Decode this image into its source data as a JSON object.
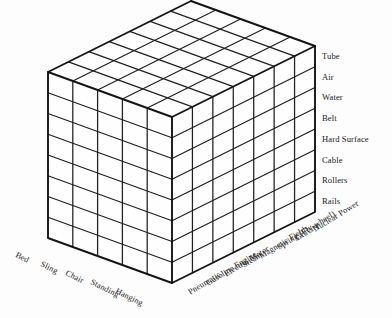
{
  "figure": {
    "kind": "morphological-box",
    "background_color": "#fdfdfd",
    "line_color": "#151515"
  },
  "axes": {
    "vertical": {
      "name": "guideway-medium",
      "position": "right",
      "label_order": "top-to-bottom",
      "divisions": 8,
      "labels": [
        "Tube",
        "Air",
        "Water",
        "Belt",
        "Hard Surface",
        "Cable",
        "Rollers",
        "Rails"
      ]
    },
    "depth_left": {
      "name": "support-mode",
      "position": "bottom-left",
      "divisions": 5,
      "labels": [
        "Hanging",
        "Standing",
        "Chair",
        "Sling",
        "Bed"
      ]
    },
    "depth_right": {
      "name": "power-source",
      "position": "bottom-right",
      "divisions": 7,
      "labels": [
        "Pneumatic",
        "Gasoline Engine",
        "Electric Motor",
        "Steam",
        "Magnetic Fields",
        "Spring (Fly-wheel)",
        "Gravity",
        "Nuclear Power"
      ]
    }
  },
  "geometry": {
    "front_bottom": [
      172,
      283
    ],
    "front_top": [
      172,
      117
    ],
    "left_bottom": [
      48,
      238
    ],
    "left_top": [
      48,
      75
    ],
    "right_bottom": [
      315,
      212
    ],
    "right_top": [
      315,
      47
    ],
    "back_top": [
      200,
      13
    ],
    "cells_vertical": 8,
    "cells_left": 5,
    "cells_right": 7
  }
}
